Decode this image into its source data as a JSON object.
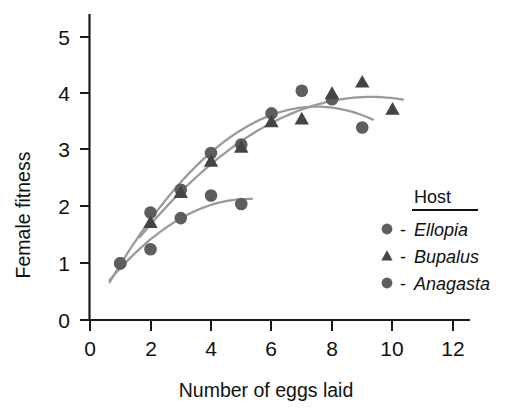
{
  "chart_data": {
    "type": "scatter",
    "title": "",
    "xlabel": "Number of eggs laid",
    "ylabel": "Female fitness",
    "xlim": [
      0,
      12.6
    ],
    "ylim": [
      0,
      5.4
    ],
    "xticks": [
      0,
      2,
      4,
      6,
      8,
      10,
      12
    ],
    "xtick_labels": [
      "0",
      "2",
      "4",
      "6",
      "8",
      "10",
      "12"
    ],
    "yticks": [
      0,
      1,
      2,
      3,
      4,
      5
    ],
    "ytick_labels": [
      "0",
      "1",
      "2",
      "3",
      "4",
      "5"
    ],
    "grid": false,
    "legend_position": "right-middle",
    "series": [
      {
        "name": "Ellopia",
        "marker": "circle",
        "color": "#5e5e5e",
        "x": [
          1,
          2,
          3,
          4,
          5,
          6,
          7,
          8,
          9
        ],
        "y": [
          1.0,
          1.9,
          2.3,
          2.95,
          3.1,
          3.65,
          4.05,
          3.9,
          3.4
        ],
        "fit": "quadratic"
      },
      {
        "name": "Bupalus",
        "marker": "triangle",
        "color": "#444444",
        "x": [
          2,
          3,
          4,
          5,
          6,
          7,
          8,
          9,
          10
        ],
        "y": [
          1.72,
          2.25,
          2.8,
          3.05,
          3.5,
          3.55,
          4.0,
          4.2,
          3.72
        ],
        "fit": "quadratic"
      },
      {
        "name": "Anagasta",
        "marker": "circle",
        "color": "#5e5e5e",
        "x": [
          1,
          2,
          3,
          4,
          5
        ],
        "y": [
          1.0,
          1.25,
          1.8,
          2.2,
          2.05
        ],
        "fit": "quadratic"
      }
    ]
  },
  "legend": {
    "title": "Host",
    "entries": [
      {
        "dash": "-",
        "label": "Ellopia",
        "marker": "circle"
      },
      {
        "dash": "-",
        "label": "Bupalus",
        "marker": "triangle"
      },
      {
        "dash": "-",
        "label": "Anagasta",
        "marker": "circle"
      }
    ]
  }
}
